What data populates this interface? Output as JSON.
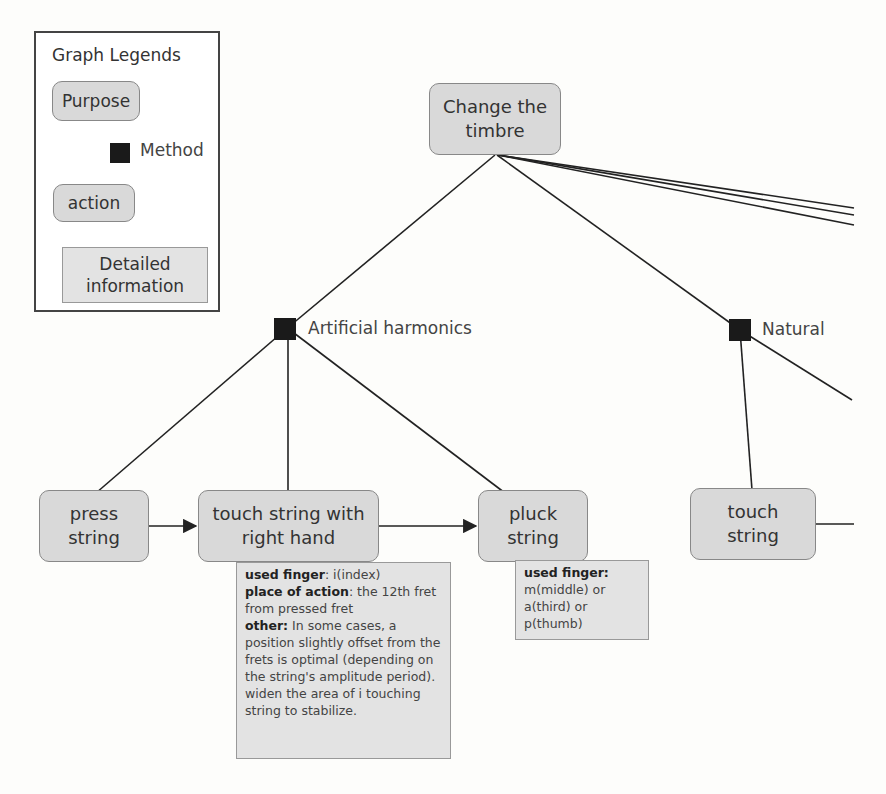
{
  "legend": {
    "title": "Graph Legends",
    "purpose": "Purpose",
    "method": "Method",
    "action": "action",
    "detail_line1": "Detailed",
    "detail_line2": "information"
  },
  "purpose_node": {
    "line1": "Change the",
    "line2": "timbre"
  },
  "methods": [
    {
      "label": "Artificial harmonics"
    },
    {
      "label": "Natural"
    }
  ],
  "actions": [
    {
      "line1": "press",
      "line2": "string"
    },
    {
      "line1": "touch string with",
      "line2": "right hand"
    },
    {
      "line1": "pluck",
      "line2": "string"
    },
    {
      "line1": "touch",
      "line2": "string"
    }
  ],
  "details": {
    "touch_right_hand": {
      "used_finger_label": "used finger",
      "used_finger_value": ": i(index)",
      "place_label": "place of action",
      "place_value": ": the 12th fret from pressed fret",
      "other_label": "other:",
      "other_value": " In some cases, a position slightly offset from the frets is optimal (depending on the string's amplitude period). widen the area of i touching string to stabilize."
    },
    "pluck": {
      "used_finger_label": "used finger:",
      "line1": "m(middle) or",
      "line2": "a(third) or",
      "line3": "p(thumb)"
    }
  },
  "colors": {
    "node_fill": "#d9d9d9",
    "detail_fill": "#e3e3e3",
    "method_square": "#1a1a1a",
    "edge": "#222222"
  }
}
